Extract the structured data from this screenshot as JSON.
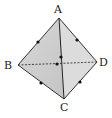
{
  "diagram": {
    "type": "tetrahedron",
    "colors": {
      "face": "#cfcfcf",
      "face_light": "#e4e4e4",
      "edge": "#333333",
      "dot": "#111111"
    },
    "vertices": {
      "A": {
        "label": "A",
        "x": 59,
        "y": 18,
        "lx": 58,
        "ly": 13
      },
      "B": {
        "label": "B",
        "x": 18,
        "y": 65,
        "lx": 10,
        "ly": 69
      },
      "C": {
        "label": "C",
        "x": 64,
        "y": 99,
        "lx": 65,
        "ly": 111
      },
      "D": {
        "label": "D",
        "x": 97,
        "y": 62,
        "lx": 104,
        "ly": 66
      }
    },
    "edges_solid": [
      "AB",
      "AD",
      "BC",
      "CD",
      "AC"
    ],
    "edges_dashed": [
      "BD"
    ],
    "midpoints": [
      {
        "edge": "AB",
        "x": 38,
        "y": 42
      },
      {
        "edge": "AD",
        "x": 77,
        "y": 40
      },
      {
        "edge": "BC",
        "x": 41,
        "y": 83
      },
      {
        "edge": "CD",
        "x": 80,
        "y": 82
      },
      {
        "edge": "AC",
        "x": 61,
        "y": 57
      },
      {
        "edge": "BD",
        "x": 57,
        "y": 64
      }
    ]
  }
}
